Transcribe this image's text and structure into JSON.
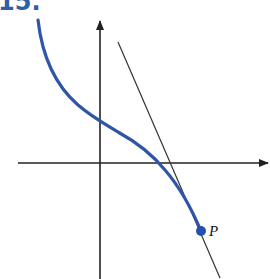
{
  "problem": {
    "number": "15."
  },
  "figure": {
    "point_label": "P",
    "colors": {
      "curve": "#2f56a6",
      "point": "#2450b0",
      "axes": "#222222",
      "tangent": "#333333",
      "problem_number": "#2f5fa8"
    }
  }
}
